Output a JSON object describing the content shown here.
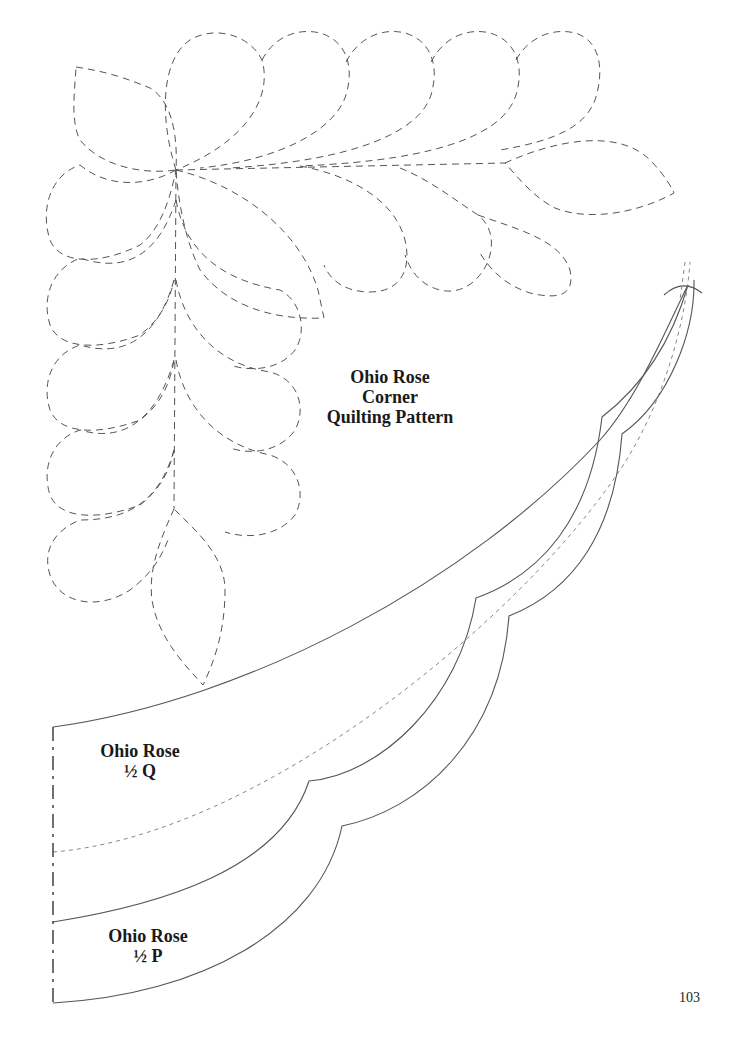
{
  "pattern": {
    "title_lines": [
      "Ohio Rose",
      "Corner",
      "Quilting Pattern"
    ]
  },
  "templates": {
    "half_q": {
      "lines": [
        "Ohio Rose",
        "½ Q"
      ]
    },
    "half_p": {
      "lines": [
        "Ohio Rose",
        "½ P"
      ]
    }
  },
  "page": {
    "number": "103"
  },
  "colors": {
    "line": "#555555",
    "text": "#1a1a1a",
    "background": "#ffffff"
  }
}
